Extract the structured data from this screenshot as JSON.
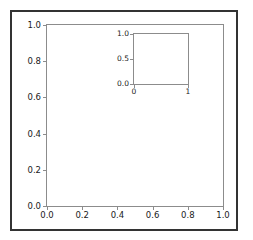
{
  "figure": {
    "background_color": "#ffffff",
    "border_color": "#333333",
    "spine_color": "#8c8c8c",
    "tick_label_color": "#1a1a1a"
  },
  "chart_data": [
    {
      "id": "main-axes",
      "type": "line",
      "title": "",
      "xlabel": "",
      "ylabel": "",
      "xlim": [
        0.0,
        1.0
      ],
      "ylim": [
        0.0,
        1.0
      ],
      "xticks": [
        0.0,
        0.2,
        0.4,
        0.6,
        0.8,
        1.0
      ],
      "yticks": [
        0.0,
        0.2,
        0.4,
        0.6,
        0.8,
        1.0
      ],
      "xticklabels": [
        "0.0",
        "0.2",
        "0.4",
        "0.6",
        "0.8",
        "1.0"
      ],
      "yticklabels": [
        "0.0",
        "0.2",
        "0.4",
        "0.6",
        "0.8",
        "1.0"
      ],
      "series": [],
      "grid": false,
      "legend": null
    },
    {
      "id": "inset-axes",
      "type": "line",
      "title": "",
      "xlabel": "",
      "ylabel": "",
      "xlim": [
        0,
        1
      ],
      "ylim": [
        0.0,
        1.0
      ],
      "xticks": [
        0,
        1
      ],
      "yticks": [
        0.0,
        0.5,
        1.0
      ],
      "xticklabels": [
        "0",
        "1"
      ],
      "yticklabels": [
        "0.0",
        "0.5",
        "1.0"
      ],
      "series": [],
      "grid": false,
      "legend": null
    }
  ]
}
